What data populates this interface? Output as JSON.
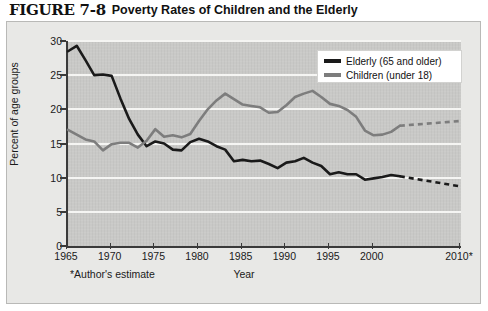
{
  "figure": {
    "number": "FIGURE 7-8",
    "title": "Poverty Rates of Children and the Elderly"
  },
  "footnote": "*Author's estimate",
  "legend": {
    "position": "top-right",
    "entries": [
      {
        "label": "Elderly (65 and older)",
        "color": "#1a1a1a",
        "swatch": "legend-swatch-elderly"
      },
      {
        "label": "Children (under 18)",
        "color": "#7d7d7d",
        "swatch": "legend-swatch-children"
      }
    ]
  },
  "colors": {
    "elderly": "#1a1a1a",
    "children": "#7d7d7d",
    "plot_background": "#c9c9c7",
    "panel_background": "#e8e8e6",
    "gridline": "#f5f5f3",
    "axis": "#3a3a3a"
  },
  "chart_data": {
    "type": "line",
    "title": "Poverty Rates of Children and the Elderly",
    "xlabel": "Year",
    "ylabel": "Percent of age groups",
    "xlim": [
      1965,
      2010
    ],
    "ylim": [
      0,
      30
    ],
    "ytick_values": [
      0,
      5,
      10,
      15,
      20,
      25,
      30
    ],
    "ytick_labels": [
      "0",
      "5",
      "10",
      "15",
      "20",
      "25",
      "30"
    ],
    "xtick_values": [
      1965,
      1970,
      1975,
      1980,
      1985,
      1990,
      1995,
      2000,
      2010
    ],
    "xtick_labels": [
      "1965",
      "1970",
      "1975",
      "1980",
      "1985",
      "1990",
      "1995",
      "2000",
      "2010*"
    ],
    "grid": "horizontal",
    "legend_position": "top-right",
    "annotations": [
      "*Author's estimate"
    ],
    "series": [
      {
        "name": "Elderly (65 and older)",
        "color": "#1a1a1a",
        "x": [
          1965,
          1966,
          1967,
          1968,
          1969,
          1970,
          1971,
          1972,
          1973,
          1974,
          1975,
          1976,
          1977,
          1978,
          1979,
          1980,
          1981,
          1982,
          1983,
          1984,
          1985,
          1986,
          1987,
          1988,
          1989,
          1990,
          1991,
          1992,
          1993,
          1994,
          1995,
          1996,
          1997,
          1998,
          1999,
          2000,
          2001,
          2002,
          2003
        ],
        "values": [
          28.5,
          29.3,
          27.2,
          25.0,
          25.1,
          24.9,
          21.6,
          18.6,
          16.3,
          14.6,
          15.3,
          15.0,
          14.1,
          14.0,
          15.2,
          15.7,
          15.3,
          14.6,
          14.1,
          12.4,
          12.6,
          12.4,
          12.5,
          12.0,
          11.4,
          12.2,
          12.4,
          12.9,
          12.2,
          11.7,
          10.5,
          10.8,
          10.5,
          10.5,
          9.7,
          9.9,
          10.1,
          10.4,
          10.2
        ],
        "projection_x": [
          2003,
          2010
        ],
        "projection_values": [
          10.2,
          8.7
        ],
        "projection_style": "dashed"
      },
      {
        "name": "Children (under 18)",
        "color": "#7d7d7d",
        "x": [
          1965,
          1966,
          1967,
          1968,
          1969,
          1970,
          1971,
          1972,
          1973,
          1974,
          1975,
          1976,
          1977,
          1978,
          1979,
          1980,
          1981,
          1982,
          1983,
          1984,
          1985,
          1986,
          1987,
          1988,
          1989,
          1990,
          1991,
          1992,
          1993,
          1994,
          1995,
          1996,
          1997,
          1998,
          1999,
          2000,
          2001,
          2002,
          2003
        ],
        "values": [
          17.0,
          16.3,
          15.6,
          15.3,
          14.0,
          14.9,
          15.1,
          15.1,
          14.4,
          15.4,
          17.1,
          16.0,
          16.2,
          15.9,
          16.4,
          18.3,
          20.0,
          21.3,
          22.3,
          21.5,
          20.7,
          20.5,
          20.3,
          19.5,
          19.6,
          20.6,
          21.8,
          22.3,
          22.7,
          21.8,
          20.8,
          20.5,
          19.9,
          18.9,
          16.9,
          16.2,
          16.3,
          16.7,
          17.6
        ],
        "projection_x": [
          2003,
          2010
        ],
        "projection_values": [
          17.6,
          18.3
        ],
        "projection_style": "dashed"
      }
    ]
  }
}
